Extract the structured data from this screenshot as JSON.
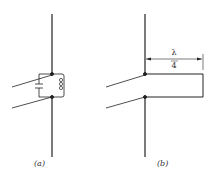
{
  "figure_a": {
    "label": "(a)",
    "components": [
      "dipole-element-upper",
      "dipole-element-lower",
      "capacitor",
      "inductor",
      "feed-line-pair"
    ]
  },
  "figure_b": {
    "label": "(b)",
    "dimension": {
      "numerator": "λ",
      "denominator": "4"
    },
    "components": [
      "dipole-element-upper",
      "dipole-element-lower",
      "quarter-wave-stub",
      "feed-line-pair"
    ]
  },
  "colors": {
    "line": "#222222",
    "background": "#ffffff"
  }
}
